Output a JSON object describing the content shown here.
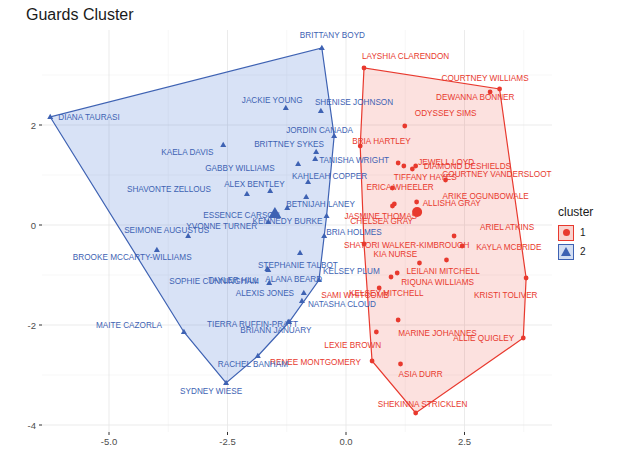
{
  "title": "Guards Cluster",
  "legend": {
    "title": "cluster",
    "items": [
      {
        "label": "1",
        "shape": "circle",
        "color": "#e8392e",
        "fill": "#f9d3cf"
      },
      {
        "label": "2",
        "shape": "triangle",
        "color": "#3e62b3",
        "fill": "#d3def2"
      }
    ]
  },
  "axes": {
    "x_ticks": [
      "-5.0",
      "-2.5",
      "0.0",
      "2.5"
    ],
    "y_ticks": [
      "2",
      "0",
      "-2",
      "-4"
    ]
  },
  "chart_data": {
    "type": "scatter",
    "title": "Guards Cluster",
    "xlabel": "",
    "ylabel": "",
    "xlim": [
      -6.6,
      4.5
    ],
    "ylim": [
      -4.1,
      3.6
    ],
    "x_ticks": [
      -5.0,
      -2.5,
      0.0,
      2.5
    ],
    "y_ticks": [
      2,
      0,
      -2,
      -4
    ],
    "grid": true,
    "legend_position": "right",
    "series": [
      {
        "name": "1",
        "shape": "circle",
        "color": "#e8392e",
        "hull": true,
        "centroid": {
          "x": 1.5,
          "y": 0.26
        },
        "points": [
          {
            "label": "LAYSHIA CLARENDON",
            "x": 0.38,
            "y": 3.14
          },
          {
            "label": "COURTNEY WILLIAMS",
            "x": 3.24,
            "y": 2.72
          },
          {
            "label": "DEWANNA BONNER",
            "x": 3.04,
            "y": 2.66
          },
          {
            "label": "ODYSSEY SIMS",
            "x": 1.24,
            "y": 1.98
          },
          {
            "label": "BRIA HARTLEY",
            "x": 0.3,
            "y": 1.58
          },
          {
            "label": "DIAMOND DESHIELDS",
            "x": 1.47,
            "y": 1.18
          },
          {
            "label": "TIFFANY HAYES",
            "x": 1.22,
            "y": 1.18
          },
          {
            "label": "COURTNEY VANDERSLOOT",
            "x": 1.4,
            "y": 1.12
          },
          {
            "label": "JEWELL LOYD",
            "x": 1.1,
            "y": 1.24
          },
          {
            "label": "ARIKE OGUNBOWALE",
            "x": 2.1,
            "y": 0.9
          },
          {
            "label": "ERICA WHEELER",
            "x": 0.98,
            "y": 0.74
          },
          {
            "label": "JASMINE THOMAS",
            "x": 0.98,
            "y": 0.38
          },
          {
            "label": "ALLISHA GRAY",
            "x": 1.49,
            "y": 0.46
          },
          {
            "label": "CHELSEA GRAY",
            "x": 1.02,
            "y": 0.42
          },
          {
            "label": "SHATORI WALKER-KIMBROUGH",
            "x": 0.38,
            "y": -0.38
          },
          {
            "label": "ARIEL ATKINS",
            "x": 2.28,
            "y": -0.22
          },
          {
            "label": "KAYLA MCBRIDE",
            "x": 2.45,
            "y": -0.42
          },
          {
            "label": "KIA NURSE",
            "x": 1.55,
            "y": -0.76
          },
          {
            "label": "LEILANI MITCHELL",
            "x": 2.12,
            "y": -0.7
          },
          {
            "label": "RIQUNA WILLIAMS",
            "x": 1.08,
            "y": -0.96
          },
          {
            "label": "KELSEY MITCHELL",
            "x": 0.95,
            "y": -1.04
          },
          {
            "label": "KRISTI TOLIVER",
            "x": 3.8,
            "y": -1.06
          },
          {
            "label": "SAMI WHITCOMB",
            "x": 0.7,
            "y": -1.26
          },
          {
            "label": "MARINE JOHANNES",
            "x": 1.1,
            "y": -1.9
          },
          {
            "label": "LEXIE BROWN",
            "x": 0.64,
            "y": -2.14
          },
          {
            "label": "ALLIE QUIGLEY",
            "x": 3.74,
            "y": -2.26
          },
          {
            "label": "RENEE MONTGOMERY",
            "x": 0.55,
            "y": -2.72
          },
          {
            "label": "ASIA DURR",
            "x": 1.15,
            "y": -2.78
          },
          {
            "label": "SHEKINNA STRICKLEN",
            "x": 1.47,
            "y": -3.76
          }
        ]
      },
      {
        "name": "2",
        "shape": "triangle",
        "color": "#3e62b3",
        "hull": true,
        "centroid": {
          "x": -1.5,
          "y": 0.22
        },
        "points": [
          {
            "label": "DIANA TAURASI",
            "x": -6.24,
            "y": 2.16
          },
          {
            "label": "BRITTANY BOYD",
            "x": -0.51,
            "y": 3.54
          },
          {
            "label": "JACKIE YOUNG",
            "x": -1.27,
            "y": 2.34
          },
          {
            "label": "SHENISE JOHNSON",
            "x": -0.53,
            "y": 2.28
          },
          {
            "label": "JORDIN CANADA",
            "x": -0.25,
            "y": 1.78
          },
          {
            "label": "BRITTNEY SYKES",
            "x": -0.63,
            "y": 1.46
          },
          {
            "label": "TANISHA WRIGHT",
            "x": -0.65,
            "y": 1.32
          },
          {
            "label": "KAELA DAVIS",
            "x": -2.59,
            "y": 1.6
          },
          {
            "label": "GABBY WILLIAMS",
            "x": -1.01,
            "y": 1.22
          },
          {
            "label": "KAHLEAH COPPER",
            "x": -0.8,
            "y": 0.86
          },
          {
            "label": "ALEX BENTLEY",
            "x": -1.6,
            "y": 0.68
          },
          {
            "label": "BETNIJAH LANEY",
            "x": -0.84,
            "y": 0.56
          },
          {
            "label": "SHAVONTE ZELLOUS",
            "x": -2.09,
            "y": 0.62
          },
          {
            "label": "ESSENCE CARSON",
            "x": -1.24,
            "y": 0.34
          },
          {
            "label": "YVONNE TURNER",
            "x": -1.64,
            "y": 0.06
          },
          {
            "label": "KENNEDY BURKE",
            "x": -0.41,
            "y": 0.18
          },
          {
            "label": "BRIA HOLMES",
            "x": -0.46,
            "y": -0.22
          },
          {
            "label": "SEIMONE AUGUSTUS",
            "x": -3.33,
            "y": -0.22
          },
          {
            "label": "BROOKE MCCARTY-WILLIAMS",
            "x": -3.99,
            "y": -0.5
          },
          {
            "label": "STEPHANIE TALBOT",
            "x": -0.97,
            "y": -0.56
          },
          {
            "label": "TAYLER HILL",
            "x": -1.64,
            "y": -0.9
          },
          {
            "label": "ALANA BEARD",
            "x": -1.66,
            "y": -0.88
          },
          {
            "label": "SOPHIE CUNNINGHAM",
            "x": -1.62,
            "y": -1.16
          },
          {
            "label": "KELSEY PLUM",
            "x": -0.57,
            "y": -1.1
          },
          {
            "label": "ALEXIS JONES",
            "x": -0.89,
            "y": -1.36
          },
          {
            "label": "NATASHA CLOUD",
            "x": -0.93,
            "y": -1.52
          },
          {
            "label": "TIERRA RUFFIN-PRATT",
            "x": -1.2,
            "y": -1.94
          },
          {
            "label": "BRIANN JANUARY",
            "x": -1.22,
            "y": -1.94
          },
          {
            "label": "MAITE CAZORLA",
            "x": -3.42,
            "y": -2.14
          },
          {
            "label": "RACHEL BANHAM",
            "x": -1.86,
            "y": -2.62
          },
          {
            "label": "SYDNEY WIESE",
            "x": -2.53,
            "y": -3.16
          }
        ]
      }
    ]
  }
}
